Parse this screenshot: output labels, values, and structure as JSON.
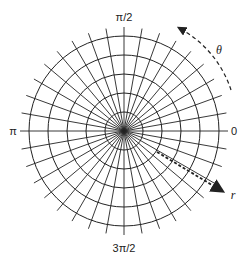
{
  "diagram": {
    "center": [
      124,
      131
    ],
    "ring_radii": [
      19,
      38,
      57,
      76,
      95
    ],
    "radial_line_count": 36,
    "radial_step_deg": 10,
    "radial_line_length": 104,
    "line_color": "#222222",
    "background": "#ffffff"
  },
  "labels": {
    "angle_0": "0",
    "angle_half_pi": "π/2",
    "angle_pi": "π",
    "angle_three_half_pi": "3π/2",
    "theta": "θ",
    "r": "r"
  },
  "arrows": {
    "theta_arrow": {
      "label": "θ",
      "direction": "counterclockwise",
      "style": "dashed"
    },
    "r_arrow": {
      "label": "r",
      "direction": "outward",
      "style": "dashed"
    }
  }
}
